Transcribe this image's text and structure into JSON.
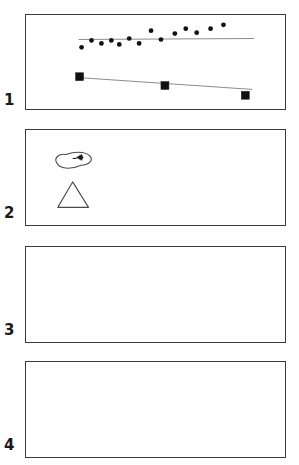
{
  "figure": {
    "width": 299,
    "height": 465,
    "background": "#ffffff",
    "line_color": "#3a3a3a",
    "marker_color": "#111111",
    "trend_color": "#8a8a8a"
  },
  "panels": [
    {
      "label": "1",
      "name": "panel-1",
      "x": 25,
      "y": 14,
      "width": 261,
      "height": 96,
      "label_x": 4,
      "label_y": 93,
      "has_content": true
    },
    {
      "label": "2",
      "name": "panel-2",
      "x": 25,
      "y": 129,
      "width": 261,
      "height": 97,
      "label_x": 4,
      "label_y": 206,
      "has_content": true
    },
    {
      "label": "3",
      "name": "panel-3",
      "x": 25,
      "y": 246,
      "width": 261,
      "height": 97,
      "label_x": 4,
      "label_y": 323,
      "has_content": false
    },
    {
      "label": "4",
      "name": "panel-4",
      "x": 25,
      "y": 361,
      "width": 261,
      "height": 97,
      "label_x": 4,
      "label_y": 438,
      "has_content": false
    }
  ],
  "chart_data": {
    "type": "scatter",
    "title": "",
    "xlabel": "",
    "ylabel": "",
    "grid": false,
    "legend": null,
    "panel": "1",
    "xlim": [
      0,
      261
    ],
    "ylim": [
      0,
      96
    ],
    "series": [
      {
        "name": "dots",
        "marker": "circle",
        "color": "#111111",
        "radius": 2.4,
        "points": [
          {
            "x": 56,
            "y": 33
          },
          {
            "x": 66,
            "y": 26
          },
          {
            "x": 76,
            "y": 29
          },
          {
            "x": 86,
            "y": 26
          },
          {
            "x": 94,
            "y": 30
          },
          {
            "x": 104,
            "y": 24
          },
          {
            "x": 114,
            "y": 29
          },
          {
            "x": 126,
            "y": 16
          },
          {
            "x": 136,
            "y": 25
          },
          {
            "x": 150,
            "y": 19
          },
          {
            "x": 161,
            "y": 14
          },
          {
            "x": 172,
            "y": 18
          },
          {
            "x": 186,
            "y": 14
          },
          {
            "x": 199,
            "y": 10
          }
        ]
      },
      {
        "name": "squares",
        "marker": "square",
        "color": "#111111",
        "size": 8,
        "points": [
          {
            "x": 54,
            "y": 63
          },
          {
            "x": 140,
            "y": 72
          },
          {
            "x": 221,
            "y": 82
          }
        ]
      }
    ],
    "reference_lines": [
      {
        "name": "dot-trendline",
        "color": "#8a8a8a",
        "x1": 53,
        "y1": 25,
        "x2": 230,
        "y2": 24
      },
      {
        "name": "square-connector",
        "color": "#8a8a8a",
        "x1": 54,
        "y1": 64,
        "x2": 228,
        "y2": 76
      }
    ]
  },
  "panel2_shapes": {
    "blob": {
      "name": "bean-blob-shape",
      "description": "elongated rounded outline with small dark mark",
      "x": 29,
      "y": 22,
      "width": 38,
      "height": 19,
      "mark_x": 51,
      "mark_y": 28
    },
    "triangle": {
      "name": "triangle-shape",
      "apex_x": 47,
      "apex_y": 53,
      "left_x": 32,
      "left_y": 79,
      "right_x": 63,
      "right_y": 79
    }
  }
}
